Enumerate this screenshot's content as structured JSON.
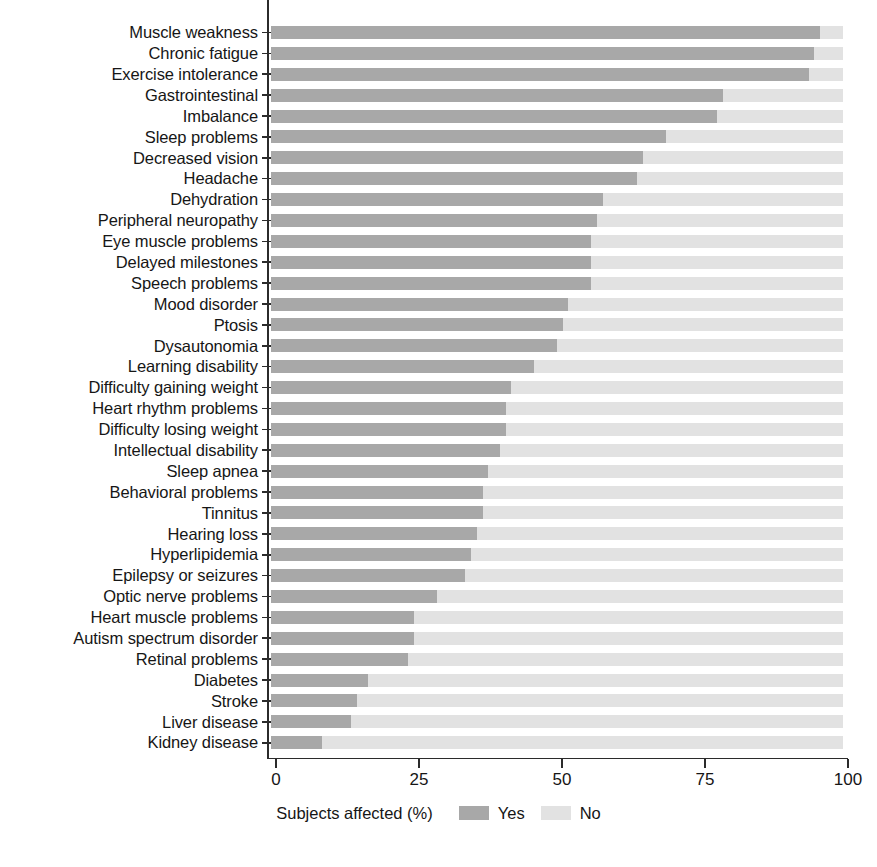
{
  "chart_data": {
    "type": "bar",
    "subtype": "horizontal-stacked-100",
    "title": "",
    "xlabel": "Subjects affected (%)",
    "ylabel": "",
    "xlim": [
      0,
      100
    ],
    "xticks": [
      0,
      25,
      50,
      75,
      100
    ],
    "xticklabels": [
      "0",
      "25",
      "50",
      "75",
      "100"
    ],
    "grid": false,
    "legend_position": "bottom",
    "legend": [
      "Yes",
      "No"
    ],
    "colors": {
      "yes": "#a8a8a8",
      "no": "#e2e2e2",
      "axis": "#2b2b2b",
      "text": "#161616"
    },
    "categories": [
      "Muscle weakness",
      "Chronic fatigue",
      "Exercise intolerance",
      "Gastrointestinal",
      "Imbalance",
      "Sleep problems",
      "Decreased vision",
      "Headache",
      "Dehydration",
      "Peripheral neuropathy",
      "Eye muscle problems",
      "Delayed milestones",
      "Speech problems",
      "Mood disorder",
      "Ptosis",
      "Dysautonomia",
      "Learning disability",
      "Difficulty gaining weight",
      "Heart rhythm problems",
      "Difficulty losing weight",
      "Intellectual disability",
      "Sleep apnea",
      "Behavioral problems",
      "Tinnitus",
      "Hearing loss",
      "Hyperlipidemia",
      "Epilepsy or seizures",
      "Optic nerve problems",
      "Heart muscle problems",
      "Autism spectrum disorder",
      "Retinal problems",
      "Diabetes",
      "Stroke",
      "Liver disease",
      "Kidney disease"
    ],
    "series": [
      {
        "name": "Yes",
        "values": [
          96,
          95,
          94,
          79,
          78,
          69,
          65,
          64,
          58,
          57,
          56,
          56,
          56,
          52,
          51,
          50,
          46,
          42,
          41,
          41,
          40,
          38,
          37,
          37,
          36,
          35,
          34,
          29,
          25,
          25,
          24,
          17,
          15,
          14,
          9
        ]
      },
      {
        "name": "No",
        "values": [
          4,
          5,
          6,
          21,
          22,
          31,
          35,
          36,
          42,
          43,
          44,
          44,
          44,
          48,
          49,
          50,
          54,
          58,
          59,
          59,
          60,
          62,
          63,
          63,
          64,
          65,
          66,
          71,
          75,
          75,
          76,
          83,
          85,
          86,
          91
        ]
      }
    ]
  },
  "legend": {
    "axis_title": "Subjects affected (%)",
    "yes_label": "Yes",
    "no_label": "No"
  }
}
